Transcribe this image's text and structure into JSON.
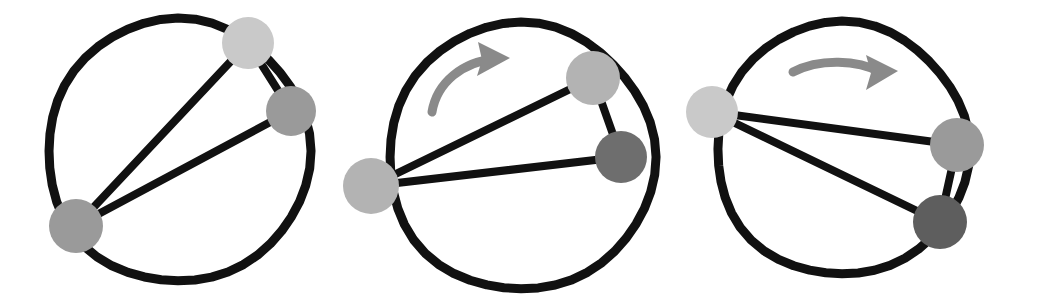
{
  "figure": {
    "background_color": "#ffffff",
    "width": 1038,
    "height": 300,
    "ring_color": "#111111",
    "edge_color": "#111111",
    "arrow_color": "#8a8a8a",
    "node_palette": {
      "light": "#c9c9c9",
      "medium_light": "#b3b3b3",
      "medium": "#9a9a9a",
      "dark": "#6e6e6e",
      "darker": "#5e5e5e"
    }
  },
  "panels": [
    {
      "id": "panel-1",
      "label": "panel-1",
      "ring": {
        "cx": 178,
        "cy": 151,
        "r": 131,
        "stroke_width": 9,
        "color": "#111111"
      },
      "arrow": null,
      "nodes": [
        {
          "id": "n1-a",
          "label": "node-light-top",
          "cx": 248,
          "cy": 43,
          "r": 26,
          "color": "#c9c9c9"
        },
        {
          "id": "n1-b",
          "label": "node-medium-right",
          "cx": 291,
          "cy": 111,
          "r": 25,
          "color": "#9a9a9a"
        },
        {
          "id": "n1-c",
          "label": "node-medium-bottomleft",
          "cx": 76,
          "cy": 226,
          "r": 27,
          "color": "#9a9a9a"
        }
      ],
      "edges": [
        {
          "id": "e1-ab",
          "from": "n1-a",
          "to": "n1-b",
          "width": 8
        },
        {
          "id": "e1-ac",
          "from": "n1-a",
          "to": "n1-c",
          "width": 8
        },
        {
          "id": "e1-bc",
          "from": "n1-b",
          "to": "n1-c",
          "width": 8
        }
      ]
    },
    {
      "id": "panel-2",
      "label": "panel-2",
      "ring": {
        "cx": 521,
        "cy": 157,
        "r": 133,
        "stroke_width": 9,
        "color": "#111111"
      },
      "arrow": {
        "id": "arrow-2",
        "label": "rotation-arrow-clockwise",
        "color": "#8a8a8a",
        "path": "M 432 112 C 437 82 463 62 494 59",
        "width": 9,
        "head": "M 478 42 L 510 58 L 477 76 L 482 60 Z"
      },
      "nodes": [
        {
          "id": "n2-a",
          "label": "node-mediumlight-top",
          "cx": 593,
          "cy": 78,
          "r": 27,
          "color": "#b3b3b3"
        },
        {
          "id": "n2-b",
          "label": "node-dark-right",
          "cx": 621,
          "cy": 157,
          "r": 26,
          "color": "#6e6e6e"
        },
        {
          "id": "n2-c",
          "label": "node-light-left",
          "cx": 371,
          "cy": 186,
          "r": 28,
          "color": "#b3b3b3"
        }
      ],
      "edges": [
        {
          "id": "e2-ab",
          "from": "n2-a",
          "to": "n2-b",
          "width": 8
        },
        {
          "id": "e2-ac",
          "from": "n2-a",
          "to": "n2-c",
          "width": 8
        },
        {
          "id": "e2-bc",
          "from": "n2-b",
          "to": "n2-c",
          "width": 8
        }
      ]
    },
    {
      "id": "panel-3",
      "label": "panel-3",
      "ring": {
        "cx": 842,
        "cy": 149,
        "r": 126,
        "stroke_width": 9,
        "color": "#111111"
      },
      "arrow": {
        "id": "arrow-3",
        "label": "rotation-arrow-clockwise",
        "color": "#8a8a8a",
        "path": "M 793 72 C 820 58 858 60 880 72",
        "width": 9,
        "head": "M 866 55 L 898 71 L 866 90 L 871 73 Z"
      },
      "nodes": [
        {
          "id": "n3-a",
          "label": "node-light-left",
          "cx": 712,
          "cy": 112,
          "r": 26,
          "color": "#c9c9c9"
        },
        {
          "id": "n3-b",
          "label": "node-medium-right",
          "cx": 957,
          "cy": 145,
          "r": 27,
          "color": "#9a9a9a"
        },
        {
          "id": "n3-c",
          "label": "node-dark-bottomright",
          "cx": 940,
          "cy": 222,
          "r": 27,
          "color": "#5e5e5e"
        }
      ],
      "edges": [
        {
          "id": "e3-ab",
          "from": "n3-a",
          "to": "n3-b",
          "width": 8
        },
        {
          "id": "e3-ac",
          "from": "n3-a",
          "to": "n3-c",
          "width": 8
        },
        {
          "id": "e3-bc",
          "from": "n3-b",
          "to": "n3-c",
          "width": 8
        }
      ]
    }
  ]
}
